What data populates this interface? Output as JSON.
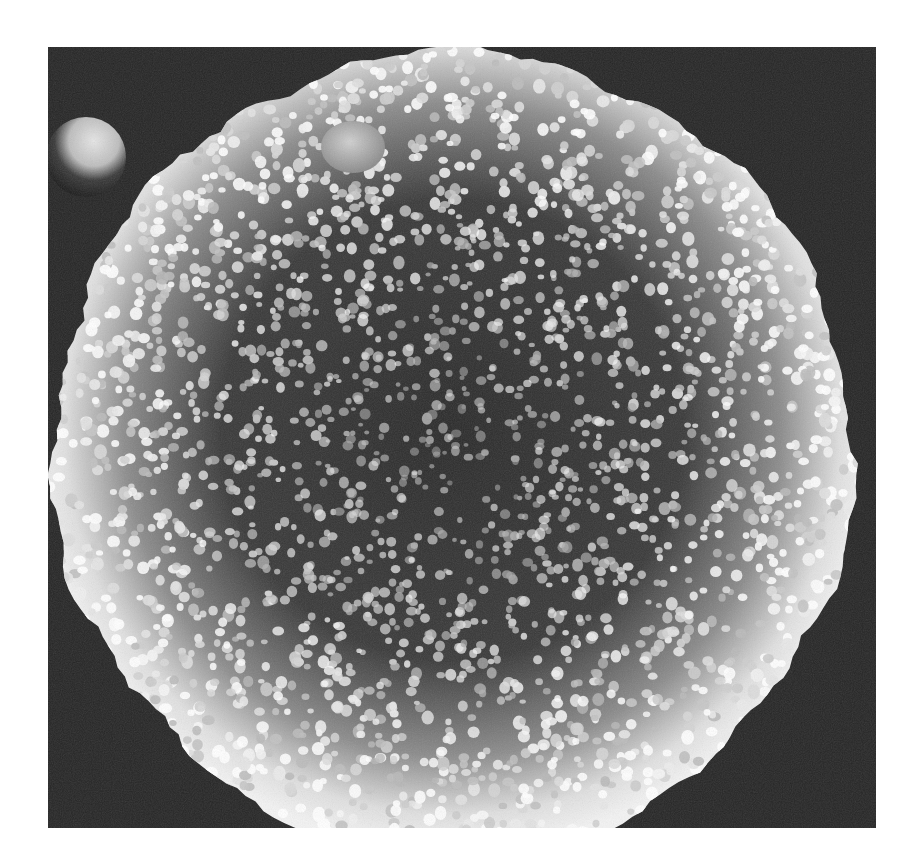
{
  "image": {
    "kind": "scanning electron micrograph",
    "subject": "spherical cell with densely packed surface microvilli / knob-like projections",
    "text_labels": [],
    "frame": {
      "x": 48,
      "y": 47,
      "width": 828,
      "height": 781
    },
    "colors": {
      "page_background": "#ffffff",
      "frame_background": "#262626",
      "sphere_rim": "#f2f2f2",
      "sphere_center": "#2a2a2a",
      "knob_highlight": "#e8e8e8"
    },
    "sphere": {
      "cx": 405,
      "cy": 405,
      "rx": 400,
      "ry": 400
    },
    "small_bleb_top": {
      "cx": 305,
      "cy": 100,
      "r": 30
    },
    "partial_cell_left": {
      "cx": 38,
      "cy": 110,
      "r": 40
    },
    "texture": {
      "seed": 7,
      "knob_count": 2600
    }
  }
}
